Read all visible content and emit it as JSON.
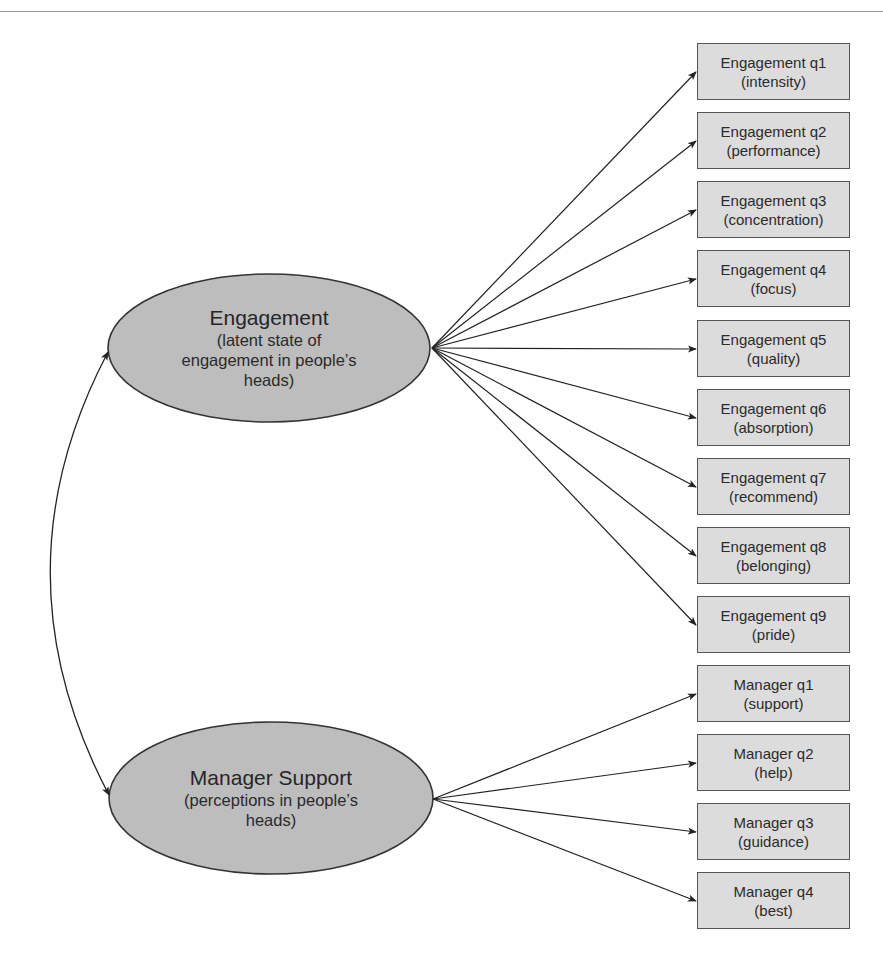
{
  "diagram": {
    "type": "structural-equation-model",
    "latent_factors": [
      {
        "id": "engagement",
        "title": "Engagement",
        "subtitle_lines": [
          "(latent state of",
          "engagement in people’s",
          "heads)"
        ]
      },
      {
        "id": "manager_support",
        "title": "Manager Support",
        "subtitle_lines": [
          "(perceptions in people’s",
          "heads)"
        ]
      }
    ],
    "indicators": [
      {
        "factor": "engagement",
        "label": "Engagement q1",
        "desc": "(intensity)"
      },
      {
        "factor": "engagement",
        "label": "Engagement q2",
        "desc": "(performance)"
      },
      {
        "factor": "engagement",
        "label": "Engagement q3",
        "desc": "(concentration)"
      },
      {
        "factor": "engagement",
        "label": "Engagement q4",
        "desc": "(focus)"
      },
      {
        "factor": "engagement",
        "label": "Engagement q5",
        "desc": "(quality)"
      },
      {
        "factor": "engagement",
        "label": "Engagement q6",
        "desc": "(absorption)"
      },
      {
        "factor": "engagement",
        "label": "Engagement q7",
        "desc": "(recommend)"
      },
      {
        "factor": "engagement",
        "label": "Engagement q8",
        "desc": "(belonging)"
      },
      {
        "factor": "engagement",
        "label": "Engagement q9",
        "desc": "(pride)"
      },
      {
        "factor": "manager_support",
        "label": "Manager q1",
        "desc": "(support)"
      },
      {
        "factor": "manager_support",
        "label": "Manager q2",
        "desc": "(help)"
      },
      {
        "factor": "manager_support",
        "label": "Manager q3",
        "desc": "(guidance)"
      },
      {
        "factor": "manager_support",
        "label": "Manager q4",
        "desc": "(best)"
      }
    ],
    "correlation": {
      "between": [
        "engagement",
        "manager_support"
      ],
      "style": "double-headed curved arrow"
    },
    "colors": {
      "ellipse_fill": "#bdbdbd",
      "box_fill": "#dcdcdc",
      "stroke": "#2a2a2a",
      "rule": "#9a9a9a"
    }
  }
}
